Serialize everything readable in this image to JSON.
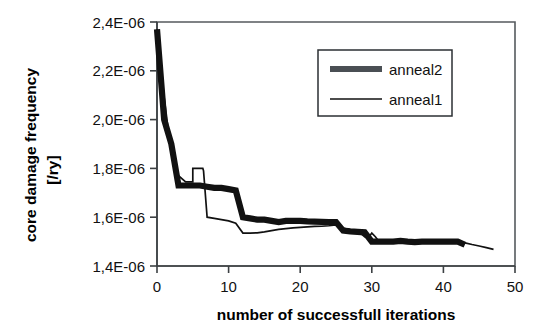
{
  "chart_data": {
    "type": "line",
    "title": "",
    "xlabel": "number of successfull iterations",
    "ylabel_line1": "core damage frequency",
    "ylabel_line2": "[/ry]",
    "xlim": [
      0,
      50
    ],
    "ylim": [
      1.4e-06,
      2.4e-06
    ],
    "xticks": [
      0,
      10,
      20,
      30,
      40,
      50
    ],
    "xtick_labels": [
      "0",
      "10",
      "20",
      "30",
      "40",
      "50"
    ],
    "yticks": [
      1.4e-06,
      1.6e-06,
      1.8e-06,
      2e-06,
      2.2e-06,
      2.4e-06
    ],
    "ytick_labels": [
      "1,4E-06",
      "1,6E-06",
      "1,8E-06",
      "2,0E-06",
      "2,2E-06",
      "2,4E-06"
    ],
    "grid": false,
    "legend_position": "top-right",
    "decimal_separator": ",",
    "series": [
      {
        "name": "anneal2",
        "style": "thick",
        "color": "#111111",
        "x": [
          0,
          1,
          1,
          2,
          2,
          3,
          3,
          4,
          5,
          6,
          7,
          8,
          9,
          10,
          11,
          11,
          12,
          12,
          13,
          14,
          15,
          16,
          17,
          17,
          18,
          19,
          20,
          21,
          22,
          23,
          24,
          25,
          25,
          26,
          26,
          27,
          28,
          29,
          29,
          30,
          30,
          31,
          32,
          33,
          34,
          35,
          36,
          37,
          38,
          39,
          40,
          41,
          42,
          43
        ],
        "y": [
          2.37e-06,
          2e-06,
          2e-06,
          1.9e-06,
          1.9e-06,
          1.73e-06,
          1.73e-06,
          1.73e-06,
          1.73e-06,
          1.73e-06,
          1.725e-06,
          1.72e-06,
          1.72e-06,
          1.715e-06,
          1.71e-06,
          1.71e-06,
          1.6e-06,
          1.6e-06,
          1.595e-06,
          1.59e-06,
          1.59e-06,
          1.585e-06,
          1.58e-06,
          1.58e-06,
          1.585e-06,
          1.585e-06,
          1.585e-06,
          1.583e-06,
          1.582e-06,
          1.581e-06,
          1.58e-06,
          1.58e-06,
          1.58e-06,
          1.545e-06,
          1.545e-06,
          1.542e-06,
          1.54e-06,
          1.538e-06,
          1.538e-06,
          1.5e-06,
          1.5e-06,
          1.5e-06,
          1.5e-06,
          1.5e-06,
          1.503e-06,
          1.5e-06,
          1.498e-06,
          1.5e-06,
          1.5e-06,
          1.5e-06,
          1.5e-06,
          1.5e-06,
          1.5e-06,
          1.487e-06
        ]
      },
      {
        "name": "anneal1",
        "style": "thin",
        "color": "#111111",
        "x": [
          0,
          1,
          2,
          3,
          3,
          4,
          5,
          5,
          6,
          6.4,
          6.5,
          7,
          7,
          8,
          9,
          10,
          11,
          12,
          12,
          13,
          14,
          15,
          16,
          17,
          18,
          19,
          20,
          21,
          22,
          23,
          24,
          25,
          26,
          27,
          28,
          29,
          29.5,
          30,
          30.5,
          31,
          32,
          33,
          34,
          35,
          36,
          37,
          38,
          39,
          40,
          41,
          42,
          43,
          44,
          45,
          46,
          47
        ],
        "y": [
          2.37e-06,
          2.09e-06,
          1.86e-06,
          1.77e-06,
          1.77e-06,
          1.745e-06,
          1.745e-06,
          1.8e-06,
          1.8e-06,
          1.8e-06,
          1.79e-06,
          1.6e-06,
          1.6e-06,
          1.595e-06,
          1.59e-06,
          1.585e-06,
          1.575e-06,
          1.535e-06,
          1.535e-06,
          1.535e-06,
          1.536e-06,
          1.54e-06,
          1.545e-06,
          1.55e-06,
          1.553e-06,
          1.556e-06,
          1.558e-06,
          1.56e-06,
          1.562e-06,
          1.563e-06,
          1.565e-06,
          1.568e-06,
          1.555e-06,
          1.548e-06,
          1.545e-06,
          1.52e-06,
          1.515e-06,
          1.535e-06,
          1.52e-06,
          1.5e-06,
          1.5e-06,
          1.5e-06,
          1.502e-06,
          1.5e-06,
          1.5e-06,
          1.5e-06,
          1.5e-06,
          1.5e-06,
          1.5e-06,
          1.5e-06,
          1.5e-06,
          1.495e-06,
          1.488e-06,
          1.482e-06,
          1.475e-06,
          1.468e-06
        ]
      }
    ],
    "legend": [
      {
        "label": "anneal2",
        "style": "thick"
      },
      {
        "label": "anneal1",
        "style": "thin"
      }
    ]
  },
  "colors": {
    "background": "#ffffff",
    "ink": "#111111",
    "frame": "#555a5e",
    "axis": "#3c4043"
  }
}
